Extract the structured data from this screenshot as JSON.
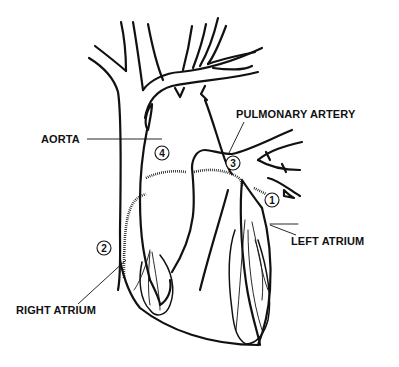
{
  "diagram": {
    "labels": {
      "aorta": "AORTA",
      "pulmonary_artery": "PULMONARY ARTERY",
      "left_atrium": "LEFT ATRIUM",
      "right_atrium": "RIGHT ATRIUM"
    },
    "markers": {
      "m1": "1",
      "m2": "2",
      "m3": "3",
      "m4": "4"
    },
    "colors": {
      "line": "#111111",
      "background": "#ffffff"
    }
  }
}
